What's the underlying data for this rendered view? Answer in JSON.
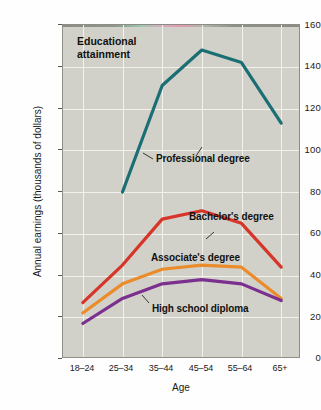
{
  "chart_data": {
    "type": "line",
    "title": "Educational attainment",
    "xlabel": "Age",
    "ylabel": "Annual earnings (thousands of dollars)",
    "categories": [
      "18–24",
      "25–34",
      "35–44",
      "45–54",
      "55–64",
      "65+"
    ],
    "yticks": [
      0,
      20,
      40,
      60,
      80,
      100,
      120,
      140,
      160
    ],
    "ylim": [
      0,
      160
    ],
    "grid": true,
    "legend": "inline-annotations",
    "series": [
      {
        "name": "Professional degree",
        "color": "#1a6f74",
        "values": [
          null,
          80,
          131,
          148,
          142,
          113
        ]
      },
      {
        "name": "Bachelor's degree",
        "color": "#d7342a",
        "values": [
          27,
          45,
          67,
          71,
          65,
          44
        ]
      },
      {
        "name": "Associate's degree",
        "color": "#ea8c2b",
        "values": [
          22,
          36,
          43,
          45,
          44,
          29
        ]
      },
      {
        "name": "High school diploma",
        "color": "#7b2f8e",
        "values": [
          17,
          29,
          36,
          38,
          36,
          28
        ]
      }
    ],
    "annotations": [
      {
        "text": "Professional degree",
        "series": "Professional degree"
      },
      {
        "text": "Bachelor's degree",
        "series": "Bachelor's degree"
      },
      {
        "text": "Associate's degree",
        "series": "Associate's degree"
      },
      {
        "text": "High school diploma",
        "series": "High school diploma"
      }
    ],
    "colors": {
      "plot_background": "#d2d1c9",
      "gridline": "#f2f1ec",
      "frame": "#8e8e86",
      "text": "#1a1a1a"
    }
  },
  "axis": {
    "y_tick_labels": [
      "160",
      "140",
      "120",
      "100",
      "80",
      "60",
      "40",
      "20",
      "0"
    ],
    "x_tick_labels": [
      "18–24",
      "25–34",
      "35–44",
      "45–54",
      "55–64",
      "65+"
    ],
    "x_title": "Age",
    "y_title": "Annual earnings (thousands of dollars)"
  },
  "labels": {
    "series_title": "Educational\nattainment",
    "professional": "Professional degree",
    "bachelors": "Bachelor's degree",
    "associates": "Associate's degree",
    "highschool": "High school diploma"
  }
}
